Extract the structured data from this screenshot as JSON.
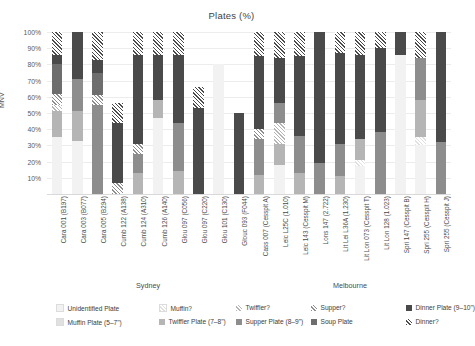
{
  "chart_data": {
    "type": "bar",
    "subtype": "stacked-percent",
    "title": "Plates (%)",
    "xlabel": "",
    "ylabel": "MNV",
    "ylim": [
      0,
      100
    ],
    "ytick_labels": [
      "10%",
      "20%",
      "30%",
      "40%",
      "50%",
      "60%",
      "70%",
      "80%",
      "90%",
      "100%"
    ],
    "ytick_values": [
      10,
      20,
      30,
      40,
      50,
      60,
      70,
      80,
      90,
      100
    ],
    "grid": true,
    "legend_position": "bottom",
    "groups": [
      {
        "name": "Sydney",
        "start": 0,
        "count": 10
      },
      {
        "name": "Melbourne",
        "start": 10,
        "count": 10
      }
    ],
    "categories": [
      "Cara 001 (B197)",
      "Cara 003 (B077)",
      "Cara 005 (B294)",
      "Cumb 122 (A138)",
      "Cumb 124 (A310)",
      "Cumb 126 (A140)",
      "Glou 097 (C056)",
      "Glou 097 (C220)",
      "Glou 101 (C130)",
      "Glouc 093 (F044)",
      "Cass 007 (Cesspit A)",
      "Leic L25C (1.010)",
      "Leic 143 (Cesspit M)",
      "Lons 147 (2.722)",
      "Lit Lei L36A (1.230)",
      "Lit Lon 073 (Cesspit T)",
      "Lit Lon 128 (1.023)",
      "Spri 147 (Cesspit B)",
      "Spri 255 (Cesspit H)",
      "Spri 255 (Cesspit J)"
    ],
    "series": [
      {
        "name": "Unidentified Plate",
        "color": "#f2f2f2",
        "hatch": false,
        "values": [
          35,
          33,
          0,
          0,
          0,
          47,
          0,
          0,
          80,
          0,
          0,
          18,
          0,
          0,
          0,
          17,
          0,
          86,
          30,
          0
        ]
      },
      {
        "name": "Muffin Plate (5–7\")",
        "color": "#e0e0e0",
        "hatch": false,
        "values": [
          0,
          0,
          0,
          0,
          0,
          0,
          0,
          0,
          0,
          0,
          0,
          0,
          0,
          0,
          0,
          0,
          0,
          0,
          0,
          0
        ]
      },
      {
        "name": "Muffin?",
        "color": "#e0e0e0",
        "hatch": true,
        "values": [
          0,
          0,
          0,
          0,
          0,
          0,
          0,
          0,
          0,
          0,
          0,
          0,
          0,
          0,
          0,
          4,
          0,
          0,
          5,
          0
        ]
      },
      {
        "name": "Twiffler Plate (7–8\")",
        "color": "#b5b5b5",
        "hatch": false,
        "values": [
          16,
          18,
          0,
          0,
          13,
          11,
          14,
          0,
          0,
          0,
          12,
          13,
          13,
          0,
          11,
          13,
          0,
          0,
          23,
          0
        ]
      },
      {
        "name": "Twiffler?",
        "color": "#b5b5b5",
        "hatch": true,
        "values": [
          4,
          0,
          0,
          0,
          0,
          0,
          0,
          0,
          0,
          0,
          0,
          13,
          0,
          0,
          0,
          0,
          0,
          0,
          0,
          0
        ]
      },
      {
        "name": "Supper Plate (8–9\")",
        "color": "#8d8d8d",
        "hatch": false,
        "values": [
          0,
          20,
          55,
          0,
          12,
          0,
          30,
          0,
          0,
          0,
          22,
          12,
          23,
          19,
          20,
          0,
          38,
          0,
          26,
          32
        ]
      },
      {
        "name": "Supper?",
        "color": "#8d8d8d",
        "hatch": true,
        "values": [
          7,
          0,
          6,
          7,
          6,
          0,
          0,
          0,
          0,
          0,
          6,
          0,
          0,
          0,
          0,
          0,
          0,
          0,
          0,
          0
        ]
      },
      {
        "name": "Soup Plate",
        "color": "#6e6e6e",
        "hatch": false,
        "values": [
          18,
          0,
          14,
          0,
          0,
          0,
          0,
          0,
          0,
          0,
          0,
          0,
          0,
          0,
          0,
          0,
          0,
          0,
          0,
          0
        ]
      },
      {
        "name": "Dinner Plate (9–10\")",
        "color": "#4a4a4a",
        "hatch": false,
        "values": [
          6,
          29,
          8,
          37,
          55,
          28,
          42,
          53,
          0,
          50,
          45,
          28,
          49,
          81,
          56,
          52,
          52,
          14,
          0,
          68
        ]
      },
      {
        "name": "Dinner?",
        "color": "#4a4a4a",
        "hatch": true,
        "values": [
          14,
          0,
          17,
          12,
          14,
          14,
          14,
          13,
          0,
          0,
          15,
          16,
          15,
          0,
          13,
          14,
          10,
          0,
          16,
          0
        ]
      }
    ]
  },
  "legend": {
    "items": [
      {
        "label": "Unidentified Plate",
        "color": "#f2f2f2",
        "hatch": false
      },
      {
        "label": "Muffin Plate (5–7\")",
        "color": "#e0e0e0",
        "hatch": false
      },
      {
        "label": "Muffin?",
        "color": "#e0e0e0",
        "hatch": true
      },
      {
        "label": "Twiffler Plate (7–8\")",
        "color": "#b5b5b5",
        "hatch": false
      },
      {
        "label": "Twiffler?",
        "color": "#b5b5b5",
        "hatch": true
      },
      {
        "label": "Supper Plate (8–9\")",
        "color": "#8d8d8d",
        "hatch": false
      },
      {
        "label": "Supper?",
        "color": "#8d8d8d",
        "hatch": true
      },
      {
        "label": "Soup Plate",
        "color": "#6e6e6e",
        "hatch": false
      },
      {
        "label": "Dinner Plate (9–10\")",
        "color": "#4a4a4a",
        "hatch": false
      },
      {
        "label": "Dinner?",
        "color": "#4a4a4a",
        "hatch": true
      }
    ]
  }
}
